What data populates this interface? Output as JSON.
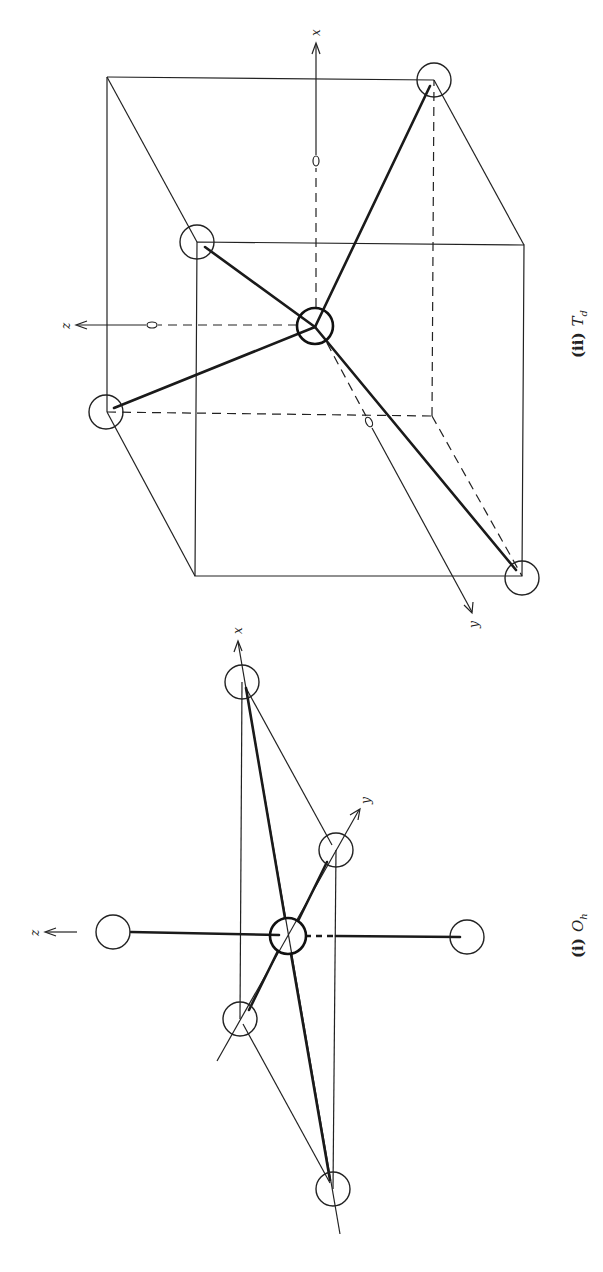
{
  "figure": {
    "orientation": "rotated-90-ccw",
    "panels": [
      {
        "id": "oh",
        "caption_prefix": "(i)",
        "caption_symbol": "O",
        "caption_sub": "h",
        "geometry": "octahedral",
        "axis_labels": {
          "x": "x",
          "y": "y",
          "z": "z"
        }
      },
      {
        "id": "td",
        "caption_prefix": "(ii)",
        "caption_symbol": "T",
        "caption_sub": "d",
        "geometry": "tetrahedral-in-cube",
        "axis_labels": {
          "x": "x",
          "y": "y",
          "z": "z"
        }
      }
    ]
  }
}
